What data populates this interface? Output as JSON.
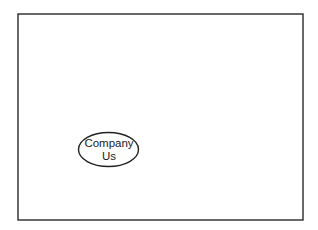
{
  "diagram": {
    "nodes": [
      {
        "id": "company",
        "shape": "ellipse",
        "lines": [
          "Company",
          "Us"
        ]
      }
    ],
    "colors": {
      "stroke": "#222222",
      "fill": "#ffffff",
      "text": "#1a1a1a"
    }
  }
}
